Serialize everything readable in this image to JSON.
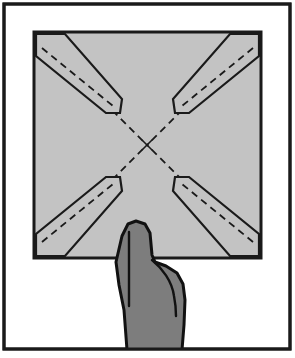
{
  "figure": {
    "description": "A square sheet of gray paper with four narrow corner wedges folded inward along dashed lines toward a center X, held from below by a hand with the thumb pressing on the sheet.",
    "canvas": {
      "width": 295,
      "height": 358,
      "background": "#ffffff"
    }
  },
  "colors": {
    "background": "#ffffff",
    "frame_stroke": "#1a1a1a",
    "paper_fill": "#c3c3c3",
    "paper_stroke": "#1a1a1a",
    "wedge_fill": "#c3c3c3",
    "wedge_stroke": "#1a1a1a",
    "fold_line": "#1a1a1a",
    "hand_fill": "#7d7d7d",
    "hand_stroke": "#111111",
    "center_mark": "#1a1a1a"
  },
  "frame": {
    "label": "outer-border",
    "x": 4,
    "y": 4,
    "width": 286,
    "height": 345,
    "stroke_width": 3
  },
  "paper": {
    "label": "paper-square",
    "x": 34,
    "y": 32,
    "width": 227,
    "height": 226,
    "stroke_width": 3,
    "fill": "#c3c3c3"
  },
  "center_mark": {
    "label": "center-cross",
    "cx": 147,
    "cy": 145,
    "arm": 5,
    "stroke_width": 1.6
  },
  "fold_lines": {
    "style": "dashed",
    "dash_pattern": "7 5",
    "stroke_width": 1.8,
    "diagonals": [
      {
        "name": "fold-line-top-left-to-center",
        "x1": 36,
        "y1": 34,
        "x2": 147,
        "y2": 145
      },
      {
        "name": "fold-line-top-right-to-center",
        "x1": 259,
        "y1": 34,
        "x2": 147,
        "y2": 145
      },
      {
        "name": "fold-line-bottom-left-to-center",
        "x1": 36,
        "y1": 256,
        "x2": 147,
        "y2": 145
      },
      {
        "name": "fold-line-bottom-right-to-center",
        "x1": 259,
        "y1": 256,
        "x2": 147,
        "y2": 145
      }
    ]
  },
  "wedges": [
    {
      "name": "wedge-top-left",
      "corner": "top-left",
      "outline": "36,56 36,34 65,34 122,99 120,113 106,113",
      "inner_dash": "42,48 113,106"
    },
    {
      "name": "wedge-top-right",
      "corner": "top-right",
      "outline": "259,56 259,34 230,34 173,99 175,113 189,113",
      "inner_dash": "253,48 182,106"
    },
    {
      "name": "wedge-bottom-left",
      "corner": "bottom-left",
      "outline": "36,234 36,256 65,256 122,191 120,177 106,177",
      "inner_dash": "42,242 113,184"
    },
    {
      "name": "wedge-bottom-right",
      "corner": "bottom-right",
      "outline": "259,234 259,256 230,256 173,191 175,177 189,177",
      "inner_dash": "253,242 182,184"
    }
  ],
  "hand": {
    "label": "hand-holding-paper",
    "fill": "#7d7d7d",
    "stroke_width": 3,
    "outline": "127,350 124,310 119,285 116,262 122,236 128,224 136,221 145,224 150,233 152,255 155,262 166,266 177,273 183,284 185,300 184,325 182,350",
    "thumb_crease": {
      "name": "thumb-crease-line",
      "x1": 129,
      "y1": 232,
      "x2": 129,
      "y2": 306
    },
    "finger_crease": {
      "name": "finger-crease-line",
      "d": "M 152,260 C 162,268 172,281 174,296 C 176,306 176,312 176,316"
    }
  },
  "annotations": {
    "step_label": "",
    "note": ""
  }
}
